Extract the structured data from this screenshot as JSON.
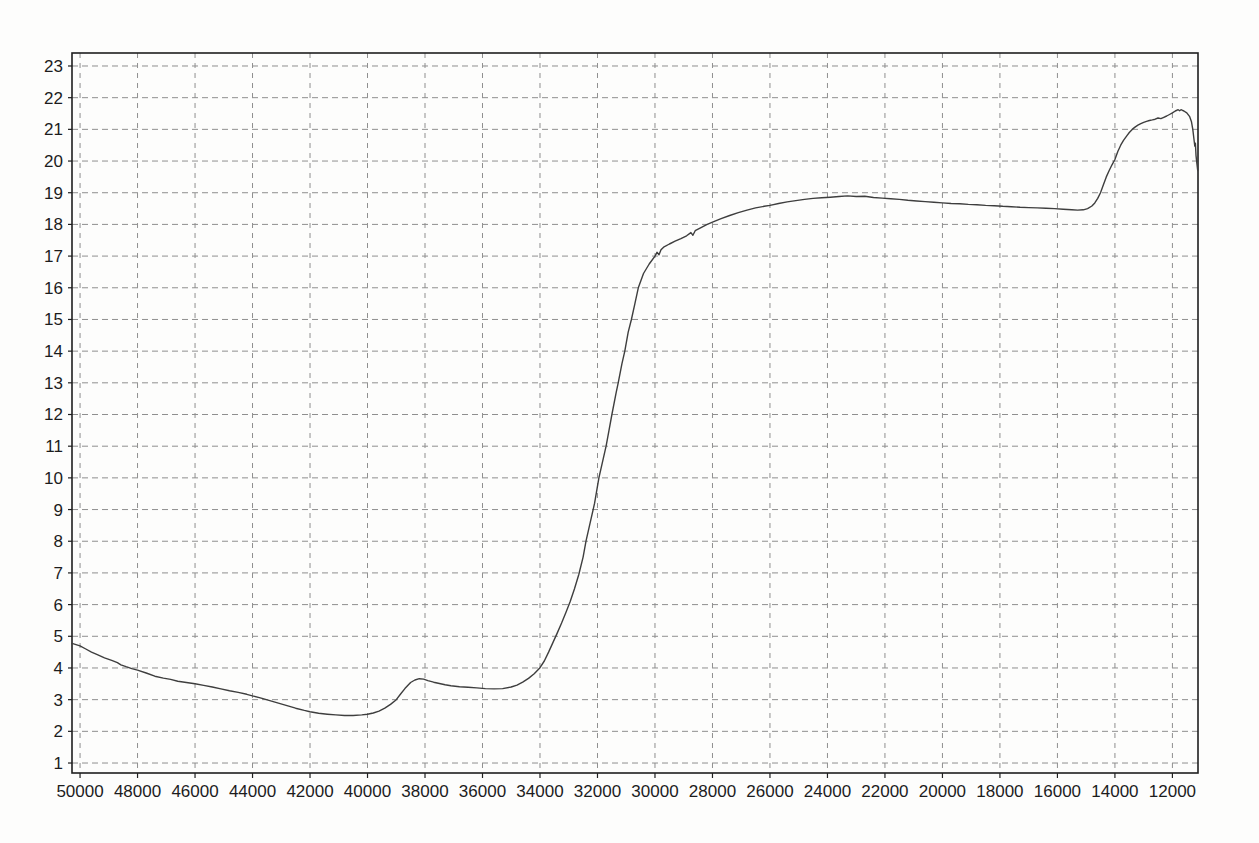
{
  "page": {
    "background_color": "#fdfdfc"
  },
  "chart_data": {
    "type": "line",
    "title": "",
    "xlabel": "",
    "ylabel": "",
    "legend": null,
    "grid": {
      "visible": true,
      "style": "dashed",
      "color": "#8f8f8f"
    },
    "colors": {
      "line": "#3e3e3e",
      "frame": "#1f1f1f",
      "tick_text": "#1c1c1c",
      "background": "#fdfdfc"
    },
    "x_axis": {
      "direction": "decreasing",
      "range": [
        50280,
        11110
      ],
      "ticks": [
        50000,
        48000,
        46000,
        44000,
        42000,
        40000,
        38000,
        36000,
        34000,
        32000,
        30000,
        28000,
        26000,
        24000,
        22000,
        20000,
        18000,
        16000,
        14000,
        12000
      ]
    },
    "y_axis": {
      "range": [
        0.685,
        23.41
      ],
      "ticks": [
        1,
        2,
        3,
        4,
        5,
        6,
        7,
        8,
        9,
        10,
        11,
        12,
        13,
        14,
        15,
        16,
        17,
        18,
        19,
        20,
        21,
        22,
        23
      ]
    },
    "series": [
      {
        "name": "trace",
        "points": [
          [
            50280,
            4.78
          ],
          [
            50000,
            4.7
          ],
          [
            49800,
            4.6
          ],
          [
            49600,
            4.5
          ],
          [
            49400,
            4.42
          ],
          [
            49150,
            4.32
          ],
          [
            48900,
            4.24
          ],
          [
            48700,
            4.17
          ],
          [
            48580,
            4.1
          ],
          [
            48400,
            4.04
          ],
          [
            48200,
            3.98
          ],
          [
            48000,
            3.93
          ],
          [
            47700,
            3.84
          ],
          [
            47400,
            3.74
          ],
          [
            47100,
            3.68
          ],
          [
            46850,
            3.64
          ],
          [
            46600,
            3.58
          ],
          [
            46300,
            3.54
          ],
          [
            46000,
            3.5
          ],
          [
            45700,
            3.45
          ],
          [
            45400,
            3.4
          ],
          [
            45100,
            3.34
          ],
          [
            44800,
            3.28
          ],
          [
            44500,
            3.23
          ],
          [
            44200,
            3.17
          ],
          [
            44000,
            3.12
          ],
          [
            43700,
            3.05
          ],
          [
            43400,
            2.97
          ],
          [
            43100,
            2.89
          ],
          [
            42800,
            2.81
          ],
          [
            42500,
            2.73
          ],
          [
            42200,
            2.66
          ],
          [
            42000,
            2.62
          ],
          [
            41700,
            2.57
          ],
          [
            41400,
            2.54
          ],
          [
            41100,
            2.52
          ],
          [
            40800,
            2.5
          ],
          [
            40500,
            2.5
          ],
          [
            40200,
            2.52
          ],
          [
            40000,
            2.54
          ],
          [
            39800,
            2.58
          ],
          [
            39600,
            2.64
          ],
          [
            39400,
            2.73
          ],
          [
            39200,
            2.85
          ],
          [
            39000,
            3.0
          ],
          [
            38850,
            3.18
          ],
          [
            38700,
            3.35
          ],
          [
            38500,
            3.54
          ],
          [
            38350,
            3.62
          ],
          [
            38200,
            3.66
          ],
          [
            38050,
            3.65
          ],
          [
            37900,
            3.6
          ],
          [
            37700,
            3.55
          ],
          [
            37500,
            3.51
          ],
          [
            37300,
            3.47
          ],
          [
            37100,
            3.44
          ],
          [
            36800,
            3.41
          ],
          [
            36500,
            3.39
          ],
          [
            36200,
            3.37
          ],
          [
            35900,
            3.35
          ],
          [
            35600,
            3.34
          ],
          [
            35300,
            3.35
          ],
          [
            35000,
            3.4
          ],
          [
            34800,
            3.46
          ],
          [
            34600,
            3.55
          ],
          [
            34400,
            3.67
          ],
          [
            34200,
            3.82
          ],
          [
            34000,
            4.01
          ],
          [
            33850,
            4.22
          ],
          [
            33700,
            4.5
          ],
          [
            33550,
            4.8
          ],
          [
            33400,
            5.1
          ],
          [
            33250,
            5.42
          ],
          [
            33100,
            5.75
          ],
          [
            32950,
            6.1
          ],
          [
            32800,
            6.5
          ],
          [
            32650,
            6.95
          ],
          [
            32500,
            7.5
          ],
          [
            32400,
            8.0
          ],
          [
            32250,
            8.6
          ],
          [
            32100,
            9.2
          ],
          [
            31950,
            10.0
          ],
          [
            31800,
            10.6
          ],
          [
            31700,
            11.0
          ],
          [
            31600,
            11.5
          ],
          [
            31500,
            12.0
          ],
          [
            31350,
            12.7
          ],
          [
            31280,
            13.0
          ],
          [
            31150,
            13.6
          ],
          [
            31050,
            14.0
          ],
          [
            30930,
            14.6
          ],
          [
            30820,
            15.0
          ],
          [
            30700,
            15.5
          ],
          [
            30580,
            16.0
          ],
          [
            30400,
            16.45
          ],
          [
            30200,
            16.75
          ],
          [
            30000,
            17.0
          ],
          [
            29930,
            17.12
          ],
          [
            29860,
            17.04
          ],
          [
            29790,
            17.2
          ],
          [
            29700,
            17.28
          ],
          [
            29500,
            17.38
          ],
          [
            29300,
            17.47
          ],
          [
            29100,
            17.55
          ],
          [
            28900,
            17.64
          ],
          [
            28750,
            17.74
          ],
          [
            28680,
            17.66
          ],
          [
            28600,
            17.8
          ],
          [
            28400,
            17.9
          ],
          [
            28200,
            17.99
          ],
          [
            28000,
            18.07
          ],
          [
            27700,
            18.18
          ],
          [
            27400,
            18.28
          ],
          [
            27100,
            18.37
          ],
          [
            26800,
            18.45
          ],
          [
            26500,
            18.52
          ],
          [
            26200,
            18.57
          ],
          [
            26000,
            18.6
          ],
          [
            25700,
            18.66
          ],
          [
            25400,
            18.71
          ],
          [
            25100,
            18.75
          ],
          [
            24800,
            18.79
          ],
          [
            24500,
            18.82
          ],
          [
            24200,
            18.84
          ],
          [
            23900,
            18.86
          ],
          [
            23600,
            18.88
          ],
          [
            23300,
            18.9
          ],
          [
            23000,
            18.88
          ],
          [
            22700,
            18.89
          ],
          [
            22400,
            18.85
          ],
          [
            22100,
            18.83
          ],
          [
            21800,
            18.81
          ],
          [
            21500,
            18.79
          ],
          [
            21200,
            18.76
          ],
          [
            20900,
            18.74
          ],
          [
            20600,
            18.72
          ],
          [
            20300,
            18.7
          ],
          [
            20000,
            18.68
          ],
          [
            19700,
            18.66
          ],
          [
            19400,
            18.65
          ],
          [
            19100,
            18.63
          ],
          [
            18800,
            18.62
          ],
          [
            18500,
            18.6
          ],
          [
            18200,
            18.59
          ],
          [
            17900,
            18.57
          ],
          [
            17600,
            18.56
          ],
          [
            17300,
            18.54
          ],
          [
            17000,
            18.53
          ],
          [
            16700,
            18.52
          ],
          [
            16400,
            18.51
          ],
          [
            16100,
            18.5
          ],
          [
            15800,
            18.48
          ],
          [
            15500,
            18.46
          ],
          [
            15300,
            18.45
          ],
          [
            15100,
            18.46
          ],
          [
            14950,
            18.5
          ],
          [
            14800,
            18.58
          ],
          [
            14700,
            18.68
          ],
          [
            14600,
            18.82
          ],
          [
            14500,
            19.0
          ],
          [
            14400,
            19.25
          ],
          [
            14300,
            19.5
          ],
          [
            14200,
            19.7
          ],
          [
            14100,
            19.88
          ],
          [
            14000,
            20.05
          ],
          [
            13900,
            20.3
          ],
          [
            13800,
            20.5
          ],
          [
            13700,
            20.65
          ],
          [
            13600,
            20.78
          ],
          [
            13500,
            20.9
          ],
          [
            13400,
            21.0
          ],
          [
            13300,
            21.07
          ],
          [
            13200,
            21.13
          ],
          [
            13100,
            21.18
          ],
          [
            13000,
            21.22
          ],
          [
            12900,
            21.25
          ],
          [
            12800,
            21.28
          ],
          [
            12700,
            21.3
          ],
          [
            12600,
            21.32
          ],
          [
            12500,
            21.36
          ],
          [
            12400,
            21.34
          ],
          [
            12300,
            21.38
          ],
          [
            12200,
            21.42
          ],
          [
            12100,
            21.47
          ],
          [
            12000,
            21.52
          ],
          [
            11900,
            21.58
          ],
          [
            11800,
            21.62
          ],
          [
            11750,
            21.59
          ],
          [
            11700,
            21.62
          ],
          [
            11650,
            21.6
          ],
          [
            11600,
            21.58
          ],
          [
            11500,
            21.52
          ],
          [
            11400,
            21.4
          ],
          [
            11340,
            21.25
          ],
          [
            11290,
            21.0
          ],
          [
            11250,
            20.68
          ],
          [
            11220,
            20.47
          ],
          [
            11200,
            20.56
          ],
          [
            11180,
            20.18
          ],
          [
            11150,
            19.92
          ],
          [
            11120,
            19.7
          ]
        ]
      }
    ]
  }
}
